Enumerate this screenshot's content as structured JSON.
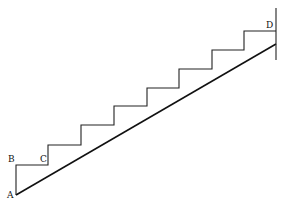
{
  "caption_fragment": "",
  "diagram": {
    "type": "staircase",
    "labels": {
      "A": "A",
      "B": "B",
      "C": "C",
      "D": "D"
    },
    "steps": 8,
    "stroke_color": "#111111",
    "wall_line": true
  }
}
